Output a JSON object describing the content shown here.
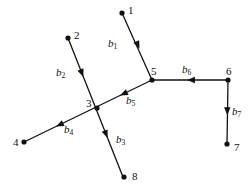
{
  "figure": {
    "kind": "directed-graph-diagram",
    "background_color": "#ffffff",
    "stroke_color": "#111111",
    "width": 251,
    "height": 190
  },
  "nodes": [
    {
      "id": "n1",
      "label": "1",
      "x": 122,
      "y": 13,
      "label_x": 128,
      "label_y": 5
    },
    {
      "id": "n2",
      "label": "2",
      "x": 68,
      "y": 38,
      "label_x": 74,
      "label_y": 30
    },
    {
      "id": "n3",
      "label": "3",
      "x": 97,
      "y": 108,
      "label_x": 86,
      "label_y": 98
    },
    {
      "id": "n4",
      "label": "4",
      "x": 24,
      "y": 142,
      "label_x": 13,
      "label_y": 137
    },
    {
      "id": "n5",
      "label": "5",
      "x": 152,
      "y": 80,
      "label_x": 151,
      "label_y": 66
    },
    {
      "id": "n6",
      "label": "6",
      "x": 228,
      "y": 80,
      "label_x": 226,
      "label_y": 66
    },
    {
      "id": "n7",
      "label": "7",
      "x": 227,
      "y": 144,
      "label_x": 234,
      "label_y": 142
    },
    {
      "id": "n8",
      "label": "8",
      "x": 124,
      "y": 177,
      "label_x": 132,
      "label_y": 171
    }
  ],
  "edges": [
    {
      "id": "b1",
      "label": "b",
      "sub": "1",
      "from": "n1",
      "to": "n5",
      "x1": 122,
      "y1": 13,
      "x2": 152,
      "y2": 80,
      "arrow_t": 0.52,
      "label_x": 108,
      "label_y": 38
    },
    {
      "id": "b2",
      "label": "b",
      "sub": "2",
      "from": "n2",
      "to": "n3",
      "x1": 68,
      "y1": 38,
      "x2": 123,
      "y2": 177,
      "arrow_t": 0.28,
      "label_x": 56,
      "label_y": 67
    },
    {
      "id": "b3",
      "label": "b",
      "sub": "3",
      "from": "n3",
      "to": "n8",
      "x1": 68,
      "y1": 38,
      "x2": 123,
      "y2": 177,
      "arrow_t": 0.72,
      "label_x": 116,
      "label_y": 134
    },
    {
      "id": "b4",
      "label": "b",
      "sub": "4",
      "from": "n3",
      "to": "n4",
      "x1": 152,
      "y1": 80,
      "x2": 24,
      "y2": 142,
      "arrow_t": 0.75,
      "label_x": 64,
      "label_y": 124
    },
    {
      "id": "b5",
      "label": "b",
      "sub": "5",
      "from": "n5",
      "to": "n3",
      "x1": 152,
      "y1": 80,
      "x2": 24,
      "y2": 142,
      "arrow_t": 0.25,
      "label_x": 126,
      "label_y": 95
    },
    {
      "id": "b6",
      "label": "b",
      "sub": "6",
      "from": "n6",
      "to": "n5",
      "x1": 228,
      "y1": 80,
      "x2": 152,
      "y2": 80,
      "arrow_t": 0.54,
      "label_x": 182,
      "label_y": 64
    },
    {
      "id": "b7",
      "label": "b",
      "sub": "7",
      "from": "n6",
      "to": "n7",
      "x1": 228,
      "y1": 80,
      "x2": 227,
      "y2": 144,
      "arrow_t": 0.55,
      "label_x": 232,
      "label_y": 106
    }
  ]
}
